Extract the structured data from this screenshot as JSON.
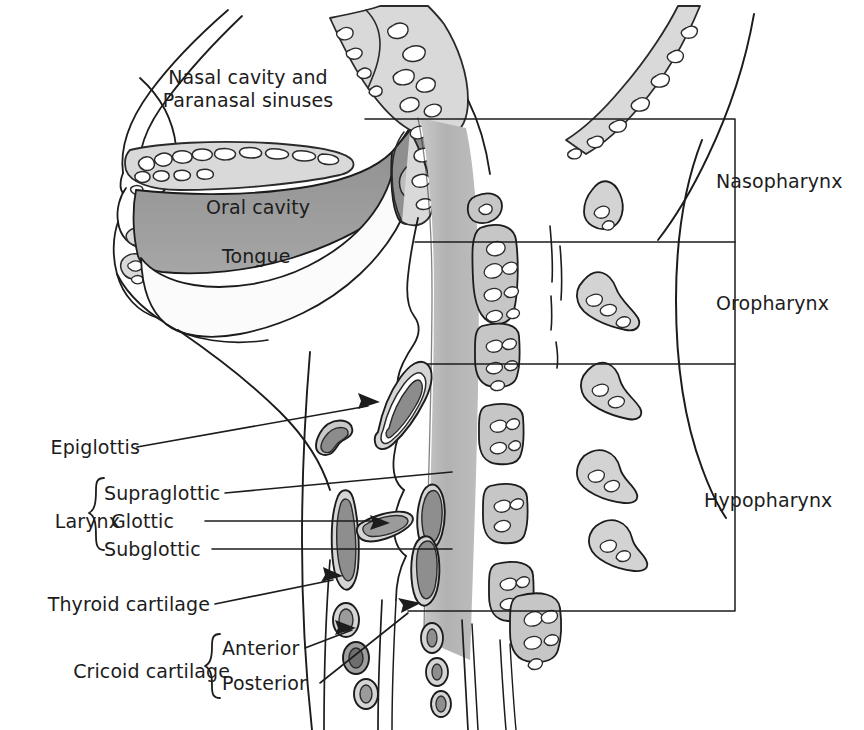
{
  "figure": {
    "type": "anatomical-sagittal-diagram",
    "background_color": "#ffffff",
    "line_color": "#1c1c1c",
    "text_color": "#1c1c1c"
  },
  "palette": {
    "ink": "#1c1c1c",
    "bone_fill": "#d9d9d9",
    "bone_edge": "#2a2a2a",
    "soft_tissue": "#bdbdbd",
    "oral_band": "#9a9a9a",
    "pharynx_column": "#b4b4b4",
    "cartilage_light": "#c9c9c9",
    "cartilage_mid": "#9e9e9e",
    "cartilage_dark": "#6e6e6e",
    "vertebra_fill": "#c6c6c6",
    "white": "#ffffff"
  },
  "labels": {
    "nasal_cavity": "Nasal cavity and\nParanasal sinuses",
    "oral_cavity": "Oral cavity",
    "tongue": "Tongue",
    "epiglottis": "Epiglottis",
    "larynx": "Larynx",
    "supraglottic": "Supraglottic",
    "glottic": "Glottic",
    "subglottic": "Subglottic",
    "thyroid_cartilage": "Thyroid cartilage",
    "cricoid_cartilage": "Cricoid cartilage",
    "anterior": "Anterior",
    "posterior": "Posterior",
    "nasopharynx": "Nasopharynx",
    "oropharynx": "Oropharynx",
    "hypopharynx": "Hypopharynx"
  },
  "regions": [
    {
      "name": "Nasopharynx",
      "bracket_top_y": 119,
      "bracket_bottom_y": 242
    },
    {
      "name": "Oropharynx",
      "bracket_top_y": 242,
      "bracket_bottom_y": 364
    },
    {
      "name": "Hypopharynx",
      "bracket_top_y": 364,
      "bracket_bottom_y": 611
    }
  ],
  "leaders": [
    {
      "for": "Epiglottis",
      "arrow": true
    },
    {
      "for": "Supraglottic",
      "arrow": false
    },
    {
      "for": "Glottic",
      "arrow": true
    },
    {
      "for": "Subglottic",
      "arrow": false
    },
    {
      "for": "Thyroid cartilage",
      "arrow": true
    },
    {
      "for": "Anterior",
      "arrow": true
    },
    {
      "for": "Posterior",
      "arrow": true
    }
  ]
}
